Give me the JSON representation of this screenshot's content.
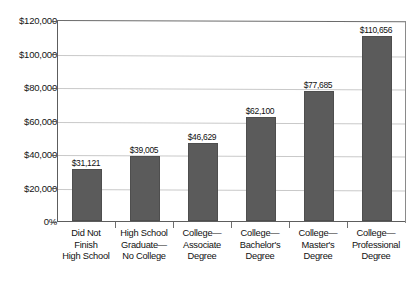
{
  "chart_data": {
    "type": "bar",
    "title": "",
    "subtitle": "",
    "xlabel": "",
    "ylabel": "",
    "categories": [
      "Did Not Finish High School",
      "High School Graduate— No College",
      "College— Associate Degree",
      "College— Bachelor's Degree",
      "College— Master's Degree",
      "College— Professional Degree"
    ],
    "category_lines": [
      [
        "Did Not",
        "Finish",
        "High School"
      ],
      [
        "High School",
        "Graduate—",
        "No College"
      ],
      [
        "College—",
        "Associate",
        "Degree"
      ],
      [
        "College—",
        "Bachelor's",
        "Degree"
      ],
      [
        "College—",
        "Master's",
        "Degree"
      ],
      [
        "College—",
        "Professional",
        "Degree"
      ]
    ],
    "values": [
      31121,
      39005,
      46629,
      62100,
      77685,
      110656
    ],
    "data_labels": [
      "$31,121",
      "$39,005",
      "$46,629",
      "$62,100",
      "$77,685",
      "$110,656"
    ],
    "ylim": [
      0,
      120000
    ],
    "ytick_values": [
      0,
      20000,
      40000,
      60000,
      80000,
      100000,
      120000
    ],
    "ytick_labels": [
      "0%",
      "$20,000",
      "$40,000",
      "$60,000",
      "$80,000",
      "$100,000",
      "$120,000"
    ],
    "grid": true,
    "grid_axis": "y",
    "legend": false,
    "legend_position": "none",
    "bar_color": "#5b5b5b",
    "grid_color": "#c9c9c9",
    "axis_color": "#5d5d5d",
    "background_color": "#ffffff"
  }
}
